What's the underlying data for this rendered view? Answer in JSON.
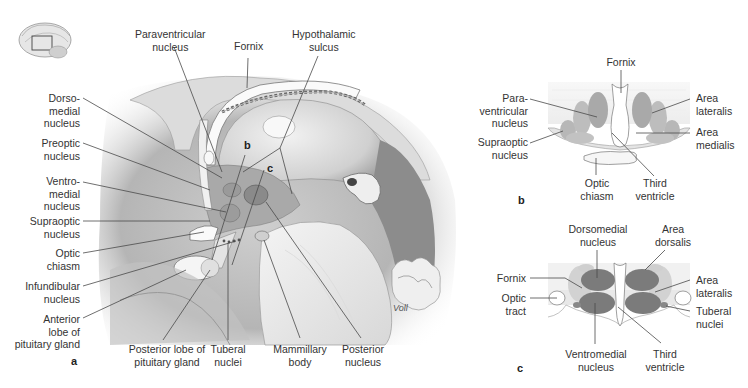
{
  "figure": {
    "panel_a": {
      "letter": "a",
      "inset_icon": "brain-sagittal-thumbnail-icon",
      "signature": "Voll",
      "labels": {
        "paraventricular": "Paraventricular\nnucleus",
        "fornix": "Fornix",
        "hypothalamic_sulcus": "Hypothalamic\nsulcus",
        "dorsomedial": "Dorso-\nmedial\nnucleus",
        "preoptic": "Preoptic\nnucleus",
        "ventromedial": "Ventro-\nmedial\nnucleus",
        "supraoptic": "Supraoptic\nnucleus",
        "optic_chiasm": "Optic\nchiasm",
        "infundibular": "Infundibular\nnucleus",
        "anterior_lobe": "Anterior\nlobe of\npituitary gland",
        "posterior_lobe": "Posterior lobe of\npituitary gland",
        "tuberal": "Tuberal\nnuclei",
        "mammillary": "Mammillary\nbody",
        "posterior_nucleus": "Posterior\nnucleus",
        "section_b": "b",
        "section_c": "c"
      }
    },
    "panel_b": {
      "letter": "b",
      "labels": {
        "fornix": "Fornix",
        "paraventricular": "Para-\nventricular\nnucleus",
        "supraoptic": "Supraoptic\nnucleus",
        "optic_chiasm": "Optic\nchiasm",
        "third_ventricle": "Third\nventricle",
        "area_lateralis": "Area\nlateralis",
        "area_medialis": "Area\nmedialis"
      }
    },
    "panel_c": {
      "letter": "c",
      "labels": {
        "dorsomedial": "Dorsomedial\nnucleus",
        "area_dorsalis": "Area\ndorsalis",
        "fornix": "Fornix",
        "optic_tract": "Optic\ntract",
        "area_lateralis": "Area\nlateralis",
        "tuberal": "Tuberal\nnuclei",
        "ventromedial": "Ventromedial\nnucleus",
        "third_ventricle": "Third\nventricle"
      }
    }
  }
}
